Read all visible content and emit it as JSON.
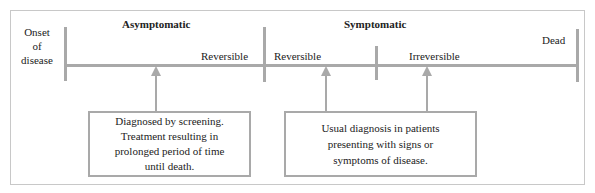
{
  "diagram": {
    "left_label": [
      "Onset",
      "of",
      "disease"
    ],
    "phases": {
      "asymptomatic": "Asymptomatic",
      "symptomatic": "Symptomatic"
    },
    "segments": {
      "reversible_1": "Reversible",
      "reversible_2": "Reversible",
      "irreversible": "Irreversible",
      "dead": "Dead"
    },
    "boxes": {
      "screening": [
        "Diagnosed by screening.",
        "Treatment resulting in",
        "prolonged period of time",
        "until death."
      ],
      "usual": [
        "Usual diagnosis in patients",
        "presenting with signs or",
        "symptoms of disease."
      ]
    },
    "colors": {
      "line": "#a9a9a9",
      "frame": "#c8c8c8",
      "text": "#222222"
    }
  }
}
